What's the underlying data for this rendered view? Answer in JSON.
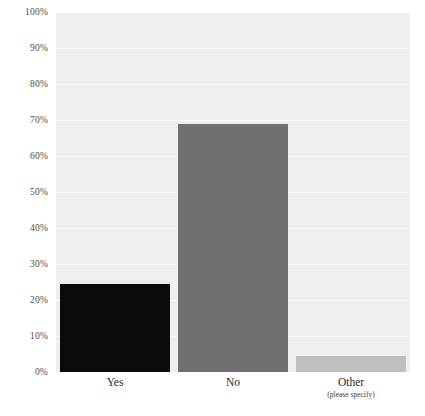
{
  "chart_data": {
    "type": "bar",
    "title": "",
    "subtitle": "",
    "xlabel": "",
    "ylabel": "",
    "categories": [
      "Yes",
      "No",
      "Other"
    ],
    "category_sublabels": [
      "",
      "",
      "(please specify)"
    ],
    "values": [
      24.5,
      69,
      4.5
    ],
    "value_labels": [
      "24.5%",
      "69%",
      "4.5%"
    ],
    "bar_colors": [
      "#0a0a0a",
      "#707070",
      "#bfbfbf"
    ],
    "ylim": [
      0,
      100
    ],
    "ytick_values": [
      100,
      90,
      80,
      70,
      60,
      50,
      40,
      30,
      20,
      10,
      0
    ],
    "ytick_labels": [
      "100%",
      "90%",
      "80%",
      "70%",
      "60%",
      "50%",
      "40%",
      "30%",
      "20%",
      "10%",
      "0%"
    ],
    "grid": true,
    "grid_axis": "y",
    "grid_color": "#fbfbfb",
    "plot_background": "#efefef",
    "page_background": "#ffffff",
    "legend": null,
    "legend_position": "none",
    "annotations": []
  },
  "colors": {
    "plot_bg": "#efefef",
    "grid": "#fbfbfb",
    "tick_text": "#4d4d4d",
    "category_text": "#262626",
    "bar_yes": "#0a0a0a",
    "bar_no": "#707070",
    "bar_other": "#bfbfbf"
  }
}
